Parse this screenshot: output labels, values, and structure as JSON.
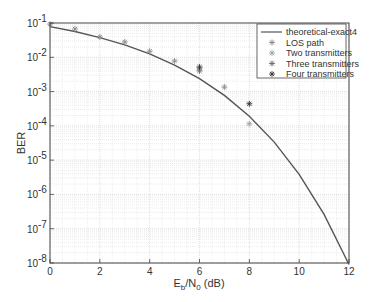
{
  "chart_data": {
    "type": "line",
    "title": "",
    "xlabel": "E_b/N_0 (dB)",
    "xlabel_parts": {
      "main": "E",
      "sub1": "b",
      "mid": "/N",
      "sub2": "0",
      "tail": " (dB)"
    },
    "ylabel": "BER",
    "xlim": [
      0,
      12
    ],
    "ylim": [
      1e-08,
      0.1
    ],
    "yscale": "log",
    "grid": true,
    "legend_position": "upper right",
    "x_ticks": [
      0,
      2,
      4,
      6,
      8,
      10,
      12
    ],
    "y_ticks": [
      {
        "exp": -1,
        "label": "10",
        "sup": "-1"
      },
      {
        "exp": -2,
        "label": "10",
        "sup": "-2"
      },
      {
        "exp": -3,
        "label": "10",
        "sup": "-3"
      },
      {
        "exp": -4,
        "label": "10",
        "sup": "-4"
      },
      {
        "exp": -5,
        "label": "10",
        "sup": "-5"
      },
      {
        "exp": -6,
        "label": "10",
        "sup": "-6"
      },
      {
        "exp": -7,
        "label": "10",
        "sup": "-7"
      },
      {
        "exp": -8,
        "label": "10",
        "sup": "-8"
      }
    ],
    "series": [
      {
        "name": "theoretical-exact4",
        "style": "line",
        "color": "#555555",
        "x": [
          0,
          1,
          2,
          3,
          4,
          5,
          6,
          7,
          8,
          9,
          10,
          11,
          12
        ],
        "values": [
          0.0786,
          0.0563,
          0.0375,
          0.0229,
          0.0125,
          0.00595,
          0.00239,
          0.000773,
          0.000191,
          3.36e-05,
          3.87e-06,
          2.61e-07,
          9.01e-09
        ]
      },
      {
        "name": "LOS path",
        "style": "marker",
        "color": "#8a8a8a",
        "x": [
          0,
          1,
          2,
          3,
          4,
          5,
          7
        ],
        "values": [
          0.093,
          0.067,
          0.039,
          0.028,
          0.015,
          0.0078,
          0.00135
        ]
      },
      {
        "name": "Two transmitters",
        "style": "marker",
        "color": "#a0a0a0",
        "x": [
          6,
          8
        ],
        "values": [
          0.0046,
          0.000115
        ]
      },
      {
        "name": "Three transmitters",
        "style": "marker",
        "color": "#6a6a6a",
        "x": [
          6
        ],
        "values": [
          0.004
        ]
      },
      {
        "name": "Four transmitters",
        "style": "marker",
        "color": "#333333",
        "x": [
          6,
          8
        ],
        "values": [
          0.0052,
          0.00044
        ]
      }
    ]
  }
}
